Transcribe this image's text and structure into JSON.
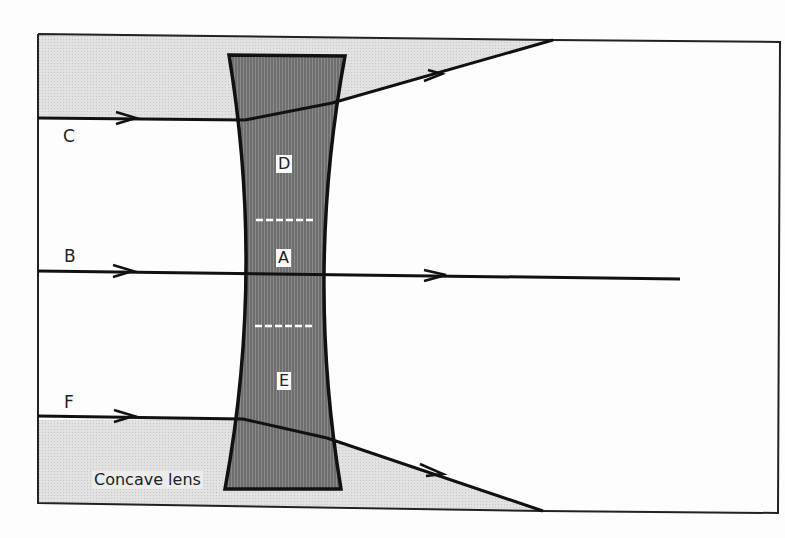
{
  "figure": {
    "lens_label": "Concave lens",
    "ray_labels": {
      "C": "C",
      "B": "B",
      "F": "F"
    },
    "region_labels": {
      "D": "D",
      "A": "A",
      "E": "E"
    },
    "colors": {
      "background": "#fdfdfd",
      "frame": "#222222",
      "lens_fill": "#7a7a7a",
      "shadow_fill": "#dcdcdc",
      "ray": "#111111",
      "dash": "#ffffff"
    }
  }
}
